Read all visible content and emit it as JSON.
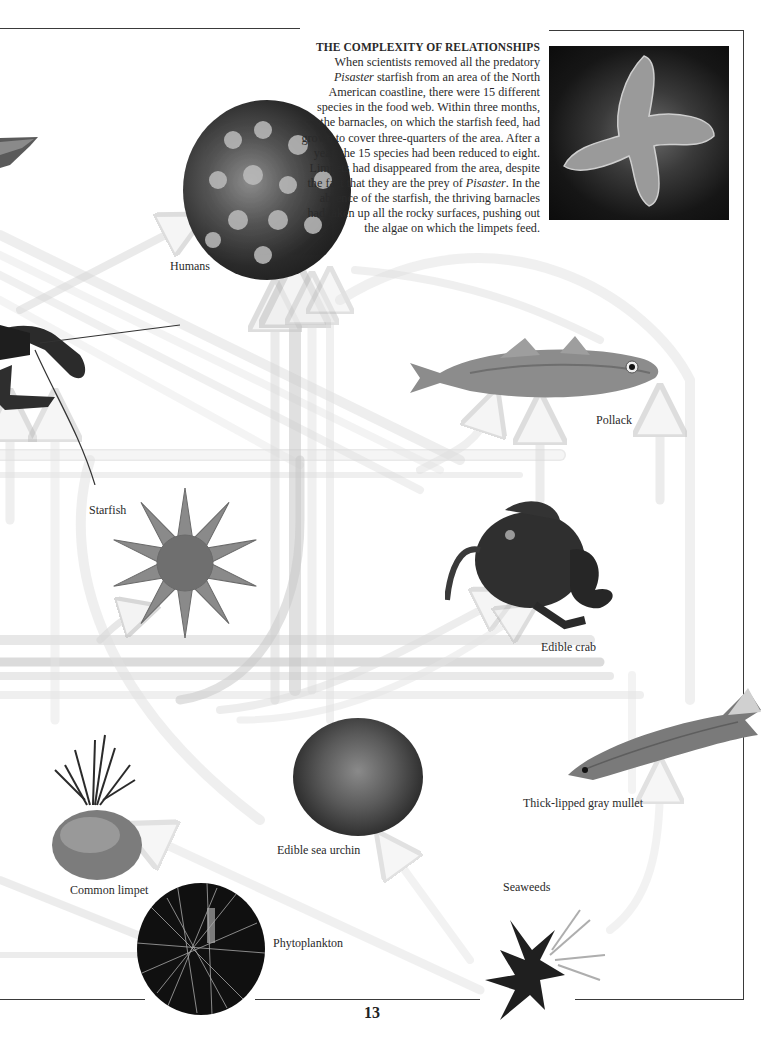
{
  "page": {
    "number": "13"
  },
  "sidebar": {
    "title": "THE COMPLEXITY OF RELATIONSHIPS",
    "lines": [
      "When scientists removed all the predatory ",
      "Pisaster",
      " starfish from an area of the North American coastline, there were 15 different species in the food web. Within three months, the barnacles, on which the starfish feed, had grown to cover three-quarters of the area. After a year, the 15 species had been reduced to eight. Limpets had disappeared from the area, despite the fact that they are the prey of ",
      "Pisaster",
      ". In the absence of the starfish, the thriving barnacles had taken up all the rocky surfaces, pushing out the algae on which the limpets feed."
    ],
    "photo": "pisaster-starfish-photo"
  },
  "organisms": {
    "humans": "Humans",
    "pollack": "Pollack",
    "starfish": "Starfish",
    "edible_crab": "Edible crab",
    "mullet": "Thick-lipped gray mullet",
    "sea_urchin": "Edible sea urchin",
    "limpet": "Common limpet",
    "seaweeds": "Seaweeds",
    "phytoplankton": "Phytoplankton"
  },
  "colors": {
    "rule": "#3a3a3a",
    "arrow_fill": "#ececec",
    "arrow_fill_dark": "#d6d6d6",
    "arrow_stroke": "#c4c4c4",
    "text": "#2a2a2a"
  }
}
